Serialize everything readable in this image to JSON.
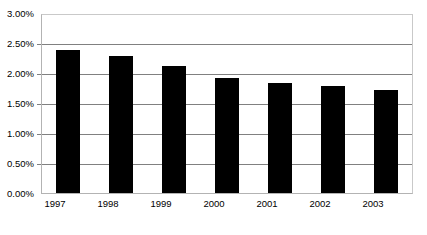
{
  "chart_data": {
    "type": "bar",
    "title": "",
    "subtitle": "",
    "xlabel": "",
    "ylabel": "",
    "categories": [
      "1997",
      "1998",
      "1999",
      "2000",
      "2001",
      "2002",
      "2003"
    ],
    "values": [
      2.38,
      2.29,
      2.12,
      1.92,
      1.83,
      1.78,
      1.71
    ],
    "value_format": "percent",
    "ylim": [
      0.0,
      3.0
    ],
    "ytick_values": [
      0.0,
      0.5,
      1.0,
      1.5,
      2.0,
      2.5,
      3.0
    ],
    "ytick_labels": [
      "0.00%",
      "0.50%",
      "1.00%",
      "1.50%",
      "2.00%",
      "2.50%",
      "3.00%"
    ],
    "grid": true,
    "grid_axis": "y",
    "legend": false,
    "legend_position": "none",
    "series": [
      {
        "name": "",
        "values": [
          2.38,
          2.29,
          2.12,
          1.92,
          1.83,
          1.78,
          1.71
        ],
        "color": "#000000"
      }
    ],
    "colors": {
      "bar": "#000000",
      "gridline": "#808080",
      "axis": "#b3b3b3",
      "background": "#ffffff",
      "text": "#000000"
    }
  }
}
